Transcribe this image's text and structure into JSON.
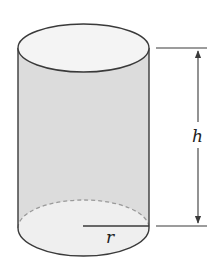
{
  "figure": {
    "labels": {
      "height": "h",
      "radius": "r"
    },
    "colors": {
      "body_fill": "#dcdcdc",
      "cap_fill": "#f2f2f2",
      "stroke": "#3a3a3a",
      "hidden_edge": "#9a9a9a"
    }
  }
}
